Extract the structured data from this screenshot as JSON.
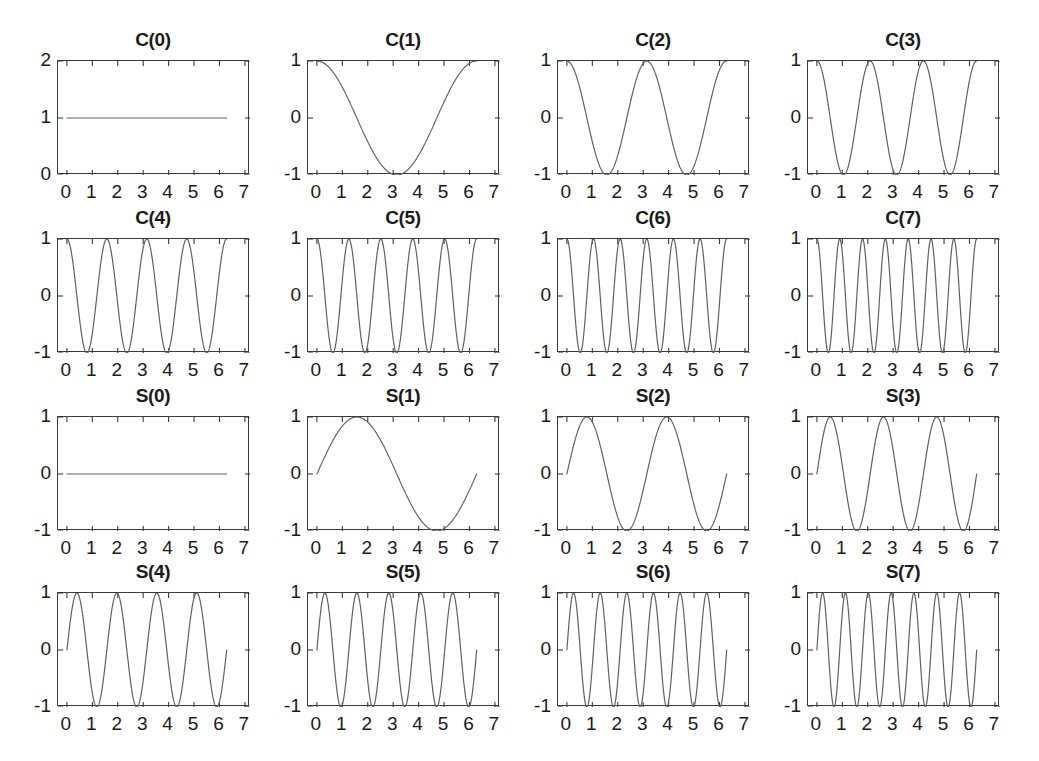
{
  "figure": {
    "background": "#ffffff",
    "line_color": "#606060",
    "axis_color": "#3a3a3a",
    "text_color": "#1a1a1a",
    "rows": 4,
    "cols": 4
  },
  "chart_data": [
    {
      "type": "line",
      "title": "C(0)",
      "function": "cos(0*x)",
      "harmonic": 0,
      "kind": "cos",
      "xlabel": "",
      "ylabel": "",
      "xlim": [
        -0.35,
        7.2
      ],
      "ylim": [
        0,
        2
      ],
      "xticks": [
        0,
        1,
        2,
        3,
        4,
        5,
        6,
        7
      ],
      "xticklabels": [
        "0",
        "1",
        "2",
        "3",
        "4",
        "5",
        "6",
        "7"
      ],
      "yticks": [
        0,
        1,
        2
      ],
      "yticklabels": [
        "0",
        "1",
        "2"
      ],
      "grid": false,
      "legend": false,
      "x_domain": [
        0,
        6.2832
      ],
      "constant_value": 1
    },
    {
      "type": "line",
      "title": "C(1)",
      "function": "cos(1*x)",
      "harmonic": 1,
      "kind": "cos",
      "xlabel": "",
      "ylabel": "",
      "xlim": [
        -0.35,
        7.2
      ],
      "ylim": [
        -1,
        1
      ],
      "xticks": [
        0,
        1,
        2,
        3,
        4,
        5,
        6,
        7
      ],
      "xticklabels": [
        "0",
        "1",
        "2",
        "3",
        "4",
        "5",
        "6",
        "7"
      ],
      "yticks": [
        -1,
        0,
        1
      ],
      "yticklabels": [
        "-1",
        "0",
        "1"
      ],
      "grid": false,
      "legend": false,
      "x_domain": [
        0,
        6.2832
      ]
    },
    {
      "type": "line",
      "title": "C(2)",
      "function": "cos(2*x)",
      "harmonic": 2,
      "kind": "cos",
      "xlabel": "",
      "ylabel": "",
      "xlim": [
        -0.35,
        7.2
      ],
      "ylim": [
        -1,
        1
      ],
      "xticks": [
        0,
        1,
        2,
        3,
        4,
        5,
        6,
        7
      ],
      "xticklabels": [
        "0",
        "1",
        "2",
        "3",
        "4",
        "5",
        "6",
        "7"
      ],
      "yticks": [
        -1,
        0,
        1
      ],
      "yticklabels": [
        "-1",
        "0",
        "1"
      ],
      "grid": false,
      "legend": false,
      "x_domain": [
        0,
        6.2832
      ]
    },
    {
      "type": "line",
      "title": "C(3)",
      "function": "cos(3*x)",
      "harmonic": 3,
      "kind": "cos",
      "xlabel": "",
      "ylabel": "",
      "xlim": [
        -0.35,
        7.2
      ],
      "ylim": [
        -1,
        1
      ],
      "xticks": [
        0,
        1,
        2,
        3,
        4,
        5,
        6,
        7
      ],
      "xticklabels": [
        "0",
        "1",
        "2",
        "3",
        "4",
        "5",
        "6",
        "7"
      ],
      "yticks": [
        -1,
        0,
        1
      ],
      "yticklabels": [
        "-1",
        "0",
        "1"
      ],
      "grid": false,
      "legend": false,
      "x_domain": [
        0,
        6.2832
      ]
    },
    {
      "type": "line",
      "title": "C(4)",
      "function": "cos(4*x)",
      "harmonic": 4,
      "kind": "cos",
      "xlabel": "",
      "ylabel": "",
      "xlim": [
        -0.35,
        7.2
      ],
      "ylim": [
        -1,
        1
      ],
      "xticks": [
        0,
        1,
        2,
        3,
        4,
        5,
        6,
        7
      ],
      "xticklabels": [
        "0",
        "1",
        "2",
        "3",
        "4",
        "5",
        "6",
        "7"
      ],
      "yticks": [
        -1,
        0,
        1
      ],
      "yticklabels": [
        "-1",
        "0",
        "1"
      ],
      "grid": false,
      "legend": false,
      "x_domain": [
        0,
        6.2832
      ]
    },
    {
      "type": "line",
      "title": "C(5)",
      "function": "cos(5*x)",
      "harmonic": 5,
      "kind": "cos",
      "xlabel": "",
      "ylabel": "",
      "xlim": [
        -0.35,
        7.2
      ],
      "ylim": [
        -1,
        1
      ],
      "xticks": [
        0,
        1,
        2,
        3,
        4,
        5,
        6,
        7
      ],
      "xticklabels": [
        "0",
        "1",
        "2",
        "3",
        "4",
        "5",
        "6",
        "7"
      ],
      "yticks": [
        -1,
        0,
        1
      ],
      "yticklabels": [
        "-1",
        "0",
        "1"
      ],
      "grid": false,
      "legend": false,
      "x_domain": [
        0,
        6.2832
      ]
    },
    {
      "type": "line",
      "title": "C(6)",
      "function": "cos(6*x)",
      "harmonic": 6,
      "kind": "cos",
      "xlabel": "",
      "ylabel": "",
      "xlim": [
        -0.35,
        7.2
      ],
      "ylim": [
        -1,
        1
      ],
      "xticks": [
        0,
        1,
        2,
        3,
        4,
        5,
        6,
        7
      ],
      "xticklabels": [
        "0",
        "1",
        "2",
        "3",
        "4",
        "5",
        "6",
        "7"
      ],
      "yticks": [
        -1,
        0,
        1
      ],
      "yticklabels": [
        "-1",
        "0",
        "1"
      ],
      "grid": false,
      "legend": false,
      "x_domain": [
        0,
        6.2832
      ]
    },
    {
      "type": "line",
      "title": "C(7)",
      "function": "cos(7*x)",
      "harmonic": 7,
      "kind": "cos",
      "xlabel": "",
      "ylabel": "",
      "xlim": [
        -0.35,
        7.2
      ],
      "ylim": [
        -1,
        1
      ],
      "xticks": [
        0,
        1,
        2,
        3,
        4,
        5,
        6,
        7
      ],
      "xticklabels": [
        "0",
        "1",
        "2",
        "3",
        "4",
        "5",
        "6",
        "7"
      ],
      "yticks": [
        -1,
        0,
        1
      ],
      "yticklabels": [
        "-1",
        "0",
        "1"
      ],
      "grid": false,
      "legend": false,
      "x_domain": [
        0,
        6.2832
      ]
    },
    {
      "type": "line",
      "title": "S(0)",
      "function": "sin(0*x)",
      "harmonic": 0,
      "kind": "sin",
      "xlabel": "",
      "ylabel": "",
      "xlim": [
        -0.35,
        7.2
      ],
      "ylim": [
        -1,
        1
      ],
      "xticks": [
        0,
        1,
        2,
        3,
        4,
        5,
        6,
        7
      ],
      "xticklabels": [
        "0",
        "1",
        "2",
        "3",
        "4",
        "5",
        "6",
        "7"
      ],
      "yticks": [
        -1,
        0,
        1
      ],
      "yticklabels": [
        "-1",
        "0",
        "1"
      ],
      "grid": false,
      "legend": false,
      "x_domain": [
        0,
        6.2832
      ],
      "constant_value": 0
    },
    {
      "type": "line",
      "title": "S(1)",
      "function": "sin(1*x)",
      "harmonic": 1,
      "kind": "sin",
      "xlabel": "",
      "ylabel": "",
      "xlim": [
        -0.35,
        7.2
      ],
      "ylim": [
        -1,
        1
      ],
      "xticks": [
        0,
        1,
        2,
        3,
        4,
        5,
        6,
        7
      ],
      "xticklabels": [
        "0",
        "1",
        "2",
        "3",
        "4",
        "5",
        "6",
        "7"
      ],
      "yticks": [
        -1,
        0,
        1
      ],
      "yticklabels": [
        "-1",
        "0",
        "1"
      ],
      "grid": false,
      "legend": false,
      "x_domain": [
        0,
        6.2832
      ]
    },
    {
      "type": "line",
      "title": "S(2)",
      "function": "sin(2*x)",
      "harmonic": 2,
      "kind": "sin",
      "xlabel": "",
      "ylabel": "",
      "xlim": [
        -0.35,
        7.2
      ],
      "ylim": [
        -1,
        1
      ],
      "xticks": [
        0,
        1,
        2,
        3,
        4,
        5,
        6,
        7
      ],
      "xticklabels": [
        "0",
        "1",
        "2",
        "3",
        "4",
        "5",
        "6",
        "7"
      ],
      "yticks": [
        -1,
        0,
        1
      ],
      "yticklabels": [
        "-1",
        "0",
        "1"
      ],
      "grid": false,
      "legend": false,
      "x_domain": [
        0,
        6.2832
      ]
    },
    {
      "type": "line",
      "title": "S(3)",
      "function": "sin(3*x)",
      "harmonic": 3,
      "kind": "sin",
      "xlabel": "",
      "ylabel": "",
      "xlim": [
        -0.35,
        7.2
      ],
      "ylim": [
        -1,
        1
      ],
      "xticks": [
        0,
        1,
        2,
        3,
        4,
        5,
        6,
        7
      ],
      "xticklabels": [
        "0",
        "1",
        "2",
        "3",
        "4",
        "5",
        "6",
        "7"
      ],
      "yticks": [
        -1,
        0,
        1
      ],
      "yticklabels": [
        "-1",
        "0",
        "1"
      ],
      "grid": false,
      "legend": false,
      "x_domain": [
        0,
        6.2832
      ]
    },
    {
      "type": "line",
      "title": "S(4)",
      "function": "sin(4*x)",
      "harmonic": 4,
      "kind": "sin",
      "xlabel": "",
      "ylabel": "",
      "xlim": [
        -0.35,
        7.2
      ],
      "ylim": [
        -1,
        1
      ],
      "xticks": [
        0,
        1,
        2,
        3,
        4,
        5,
        6,
        7
      ],
      "xticklabels": [
        "0",
        "1",
        "2",
        "3",
        "4",
        "5",
        "6",
        "7"
      ],
      "yticks": [
        -1,
        0,
        1
      ],
      "yticklabels": [
        "-1",
        "0",
        "1"
      ],
      "grid": false,
      "legend": false,
      "x_domain": [
        0,
        6.2832
      ]
    },
    {
      "type": "line",
      "title": "S(5)",
      "function": "sin(5*x)",
      "harmonic": 5,
      "kind": "sin",
      "xlabel": "",
      "ylabel": "",
      "xlim": [
        -0.35,
        7.2
      ],
      "ylim": [
        -1,
        1
      ],
      "xticks": [
        0,
        1,
        2,
        3,
        4,
        5,
        6,
        7
      ],
      "xticklabels": [
        "0",
        "1",
        "2",
        "3",
        "4",
        "5",
        "6",
        "7"
      ],
      "yticks": [
        -1,
        0,
        1
      ],
      "yticklabels": [
        "-1",
        "0",
        "1"
      ],
      "grid": false,
      "legend": false,
      "x_domain": [
        0,
        6.2832
      ]
    },
    {
      "type": "line",
      "title": "S(6)",
      "function": "sin(6*x)",
      "harmonic": 6,
      "kind": "sin",
      "xlabel": "",
      "ylabel": "",
      "xlim": [
        -0.35,
        7.2
      ],
      "ylim": [
        -1,
        1
      ],
      "xticks": [
        0,
        1,
        2,
        3,
        4,
        5,
        6,
        7
      ],
      "xticklabels": [
        "0",
        "1",
        "2",
        "3",
        "4",
        "5",
        "6",
        "7"
      ],
      "yticks": [
        -1,
        0,
        1
      ],
      "yticklabels": [
        "-1",
        "0",
        "1"
      ],
      "grid": false,
      "legend": false,
      "x_domain": [
        0,
        6.2832
      ]
    },
    {
      "type": "line",
      "title": "S(7)",
      "function": "sin(7*x)",
      "harmonic": 7,
      "kind": "sin",
      "xlabel": "",
      "ylabel": "",
      "xlim": [
        -0.35,
        7.2
      ],
      "ylim": [
        -1,
        1
      ],
      "xticks": [
        0,
        1,
        2,
        3,
        4,
        5,
        6,
        7
      ],
      "xticklabels": [
        "0",
        "1",
        "2",
        "3",
        "4",
        "5",
        "6",
        "7"
      ],
      "yticks": [
        -1,
        0,
        1
      ],
      "yticklabels": [
        "-1",
        "0",
        "1"
      ],
      "grid": false,
      "legend": false,
      "x_domain": [
        0,
        6.2832
      ]
    }
  ]
}
